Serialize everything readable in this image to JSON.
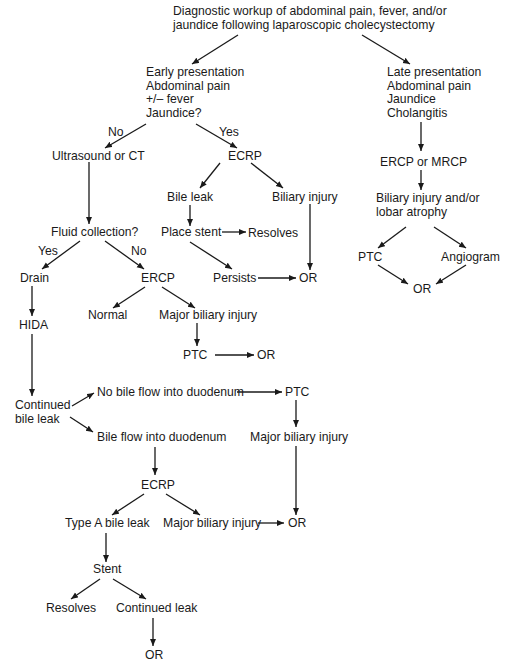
{
  "title": {
    "lines": [
      "Diagnostic workup of abdominal pain, fever, and/or",
      "jaundice following laparoscopic cholecystectomy"
    ]
  },
  "nodes": {
    "early": {
      "lines": [
        "Early presentation",
        "Abdominal pain",
        "+/– fever",
        "Jaundice?"
      ]
    },
    "late": {
      "lines": [
        "Late presentation",
        "Abdominal pain",
        "Jaundice",
        "Cholangitis"
      ]
    },
    "ultrasound_ct": {
      "label": "Ultrasound or CT"
    },
    "ecrp_1": {
      "label": "ECRP"
    },
    "bile_leak": {
      "label": "Bile leak"
    },
    "biliary_injury_1": {
      "label": "Biliary injury"
    },
    "place_stent": {
      "label": "Place stent"
    },
    "resolves_1": {
      "label": "Resolves"
    },
    "persists": {
      "label": "Persists"
    },
    "or_1": {
      "label": "OR"
    },
    "fluid_collection": {
      "label": "Fluid collection?"
    },
    "drain": {
      "label": "Drain"
    },
    "ercp_2": {
      "label": "ERCP"
    },
    "normal": {
      "label": "Normal"
    },
    "major_biliary_injury_1": {
      "label": "Major biliary injury"
    },
    "ptc_1": {
      "label": "PTC"
    },
    "or_2": {
      "label": "OR"
    },
    "hida": {
      "label": "HIDA"
    },
    "continued_bile_leak": {
      "lines": [
        "Continued",
        "bile leak"
      ]
    },
    "no_bile_flow": {
      "label": "No bile flow into duodenum"
    },
    "ptc_2": {
      "label": "PTC"
    },
    "bile_flow": {
      "label": "Bile flow into duodenum"
    },
    "major_biliary_injury_2": {
      "label": "Major biliary injury"
    },
    "ecrp_3": {
      "label": "ECRP"
    },
    "type_a_bile_leak": {
      "label": "Type A bile leak"
    },
    "major_biliary_injury_3": {
      "label": "Major biliary injury"
    },
    "or_3": {
      "label": "OR"
    },
    "stent": {
      "label": "Stent"
    },
    "resolves_2": {
      "label": "Resolves"
    },
    "continued_leak": {
      "label": "Continued leak"
    },
    "or_4": {
      "label": "OR"
    },
    "ercp_mrcp": {
      "label": "ERCP or MRCP"
    },
    "biliary_injury_atrophy": {
      "lines": [
        "Biliary injury and/or",
        "lobar atrophy"
      ]
    },
    "ptc_3": {
      "label": "PTC"
    },
    "angiogram": {
      "label": "Angiogram"
    },
    "or_5": {
      "label": "OR"
    }
  },
  "edge_labels": {
    "no_1": "No",
    "yes_1": "Yes",
    "yes_2": "Yes",
    "no_2": "No"
  }
}
